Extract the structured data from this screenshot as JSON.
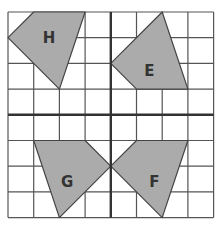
{
  "grid": {
    "origin_x": 8,
    "origin_y": 12,
    "cell": 25.7,
    "cols": 8,
    "rows": 8,
    "center_col": 4,
    "center_row": 4,
    "line_color": "#555555",
    "axis_color": "#333333"
  },
  "shapes": [
    {
      "id": "H",
      "label": "H",
      "points": [
        [
          1,
          0
        ],
        [
          3,
          0
        ],
        [
          2,
          3
        ],
        [
          0,
          1
        ]
      ],
      "label_pos": [
        1.6,
        1.0
      ]
    },
    {
      "id": "E",
      "label": "E",
      "points": [
        [
          6,
          0
        ],
        [
          7,
          3
        ],
        [
          5,
          3
        ],
        [
          4,
          2
        ]
      ],
      "label_pos": [
        5.5,
        2.3
      ]
    },
    {
      "id": "G",
      "label": "G",
      "points": [
        [
          1,
          5
        ],
        [
          3,
          5
        ],
        [
          4,
          6
        ],
        [
          2,
          8
        ]
      ],
      "label_pos": [
        2.3,
        6.6
      ]
    },
    {
      "id": "F",
      "label": "F",
      "points": [
        [
          5,
          5
        ],
        [
          7,
          5
        ],
        [
          6,
          8
        ],
        [
          4,
          6
        ]
      ],
      "label_pos": [
        5.7,
        6.6
      ]
    }
  ],
  "colors": {
    "shape_fill": "#ababab",
    "shape_stroke": "#444444",
    "label": "#333333"
  }
}
